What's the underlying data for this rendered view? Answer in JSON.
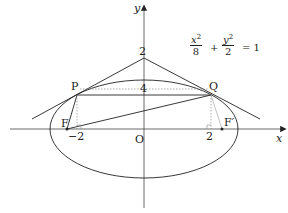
{
  "diagram": {
    "equation": {
      "term1_num": "x",
      "term1_exp": "2",
      "term1_den": "8",
      "plus": "+",
      "term2_num": "y",
      "term2_exp": "2",
      "term2_den": "2",
      "equals": "= 1"
    },
    "axes": {
      "x_label": "x",
      "y_label": "y",
      "origin_label": "O"
    },
    "points": {
      "P": "P",
      "Q": "Q",
      "F": "F",
      "F_prime": "F′"
    },
    "ticks": {
      "y_top": "2",
      "chord_length": "4",
      "x_neg": "−2",
      "x_pos": "2"
    },
    "colors": {
      "stroke": "#222222",
      "dotted": "#888888",
      "background": "#ffffff"
    }
  }
}
